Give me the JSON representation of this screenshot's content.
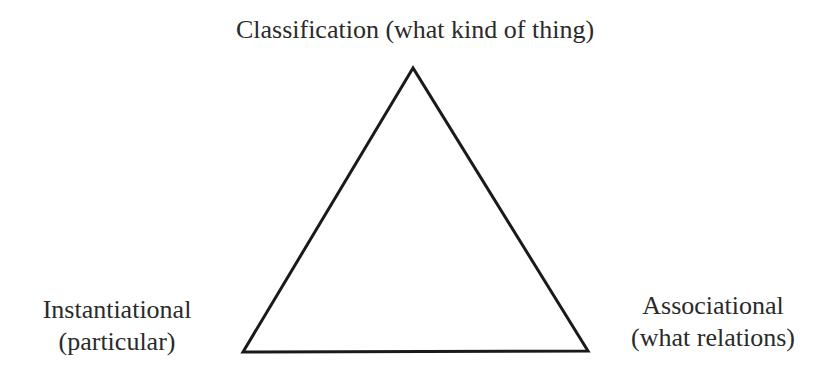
{
  "diagram": {
    "type": "triangle",
    "stroke_color": "#1a1a1a",
    "vertices": {
      "top": {
        "title": "Classification (what kind of thing)"
      },
      "bottom_left": {
        "line1": "Instantiational",
        "line2": "(particular)"
      },
      "bottom_right": {
        "line1": "Associational",
        "line2": "(what relations)"
      }
    }
  }
}
